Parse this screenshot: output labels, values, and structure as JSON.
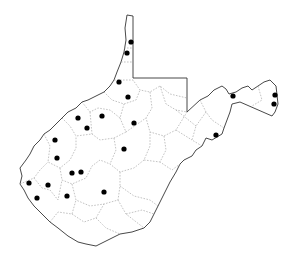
{
  "map": {
    "region": "West Virginia",
    "style": "county outline map with point localities",
    "colors": {
      "background": "#ffffff",
      "outline": "#333333",
      "county_lines": "#9a9a9a",
      "dots": "#000000"
    },
    "dot_radius": 2.6,
    "points": [
      {
        "x": 131,
        "y": 42
      },
      {
        "x": 127,
        "y": 53
      },
      {
        "x": 119,
        "y": 82
      },
      {
        "x": 128,
        "y": 97
      },
      {
        "x": 78,
        "y": 118
      },
      {
        "x": 102,
        "y": 116
      },
      {
        "x": 87,
        "y": 128
      },
      {
        "x": 134,
        "y": 123
      },
      {
        "x": 55,
        "y": 140
      },
      {
        "x": 57,
        "y": 158
      },
      {
        "x": 72,
        "y": 173
      },
      {
        "x": 81,
        "y": 172
      },
      {
        "x": 29,
        "y": 183
      },
      {
        "x": 48,
        "y": 185
      },
      {
        "x": 67,
        "y": 196
      },
      {
        "x": 37,
        "y": 198
      },
      {
        "x": 104,
        "y": 192
      },
      {
        "x": 124,
        "y": 149
      },
      {
        "x": 233,
        "y": 96
      },
      {
        "x": 275,
        "y": 95
      },
      {
        "x": 274,
        "y": 104
      },
      {
        "x": 216,
        "y": 135
      }
    ]
  }
}
